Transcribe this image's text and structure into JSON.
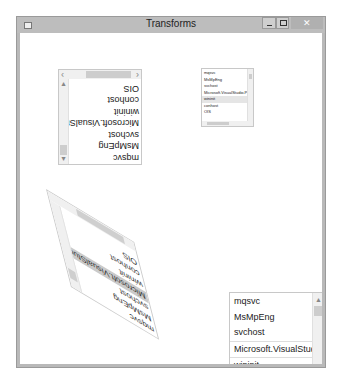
{
  "window": {
    "title": "Transforms",
    "controls": {
      "minimize": "minimize",
      "maximize": "maximize",
      "close": "✕"
    }
  },
  "listbox_items": [
    "mqsvc",
    "MsMpEng",
    "svchost",
    "Microsoft.VisualStudio.Pe",
    "wininit",
    "conhost",
    "OIS"
  ],
  "listboxes": [
    {
      "name": "rotated-listbox",
      "transform": "rotate 180",
      "selected_index": -1
    },
    {
      "name": "scaled-listbox",
      "transform": "scale 0.5",
      "selected_index": 4
    },
    {
      "name": "skewed-listbox",
      "transform": "skew",
      "selected_index": 3
    },
    {
      "name": "plain-listbox",
      "transform": "none",
      "selected_index": 3
    }
  ],
  "icons": {
    "scroll_up": "▲",
    "scroll_down": "▼",
    "scroll_left": "‹",
    "scroll_right": "›"
  },
  "colors": {
    "titlebar": "#bdbdbd",
    "selection": "#e5e5e5",
    "scroll_thumb": "#cdcdcd"
  }
}
